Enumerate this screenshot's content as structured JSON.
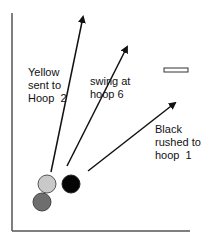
{
  "diagram": {
    "type": "croquet-shot-diagram",
    "colors": {
      "border": "#555555",
      "arrow": "#111111",
      "yellow_ball": "#c9c9c9",
      "gray_ball": "#6e6e6e",
      "black_ball": "#050505",
      "hoop_fill": "#ffffff",
      "hoop_stroke": "#333333"
    },
    "balls": [
      {
        "name": "yellow",
        "cx": 47,
        "cy": 184,
        "r": 9
      },
      {
        "name": "dark-gray",
        "cx": 42,
        "cy": 202,
        "r": 9
      },
      {
        "name": "black",
        "cx": 71,
        "cy": 184,
        "r": 9
      }
    ],
    "arrows": [
      {
        "name": "yellow-arrow",
        "x1": 51,
        "y1": 172,
        "x2": 83,
        "y2": 17
      },
      {
        "name": "swing-arrow",
        "x1": 67,
        "y1": 166,
        "x2": 127,
        "y2": 47
      },
      {
        "name": "black-arrow",
        "x1": 88,
        "y1": 171,
        "x2": 175,
        "y2": 103
      }
    ],
    "hoop": {
      "x": 164,
      "y": 68,
      "width": 24,
      "height": 4
    },
    "labels": {
      "yellow": "Yellow\nsent to\nHoop  2",
      "swing": "swing at\nhoop 6",
      "black": "Black\nrushed to\nhoop  1"
    }
  }
}
